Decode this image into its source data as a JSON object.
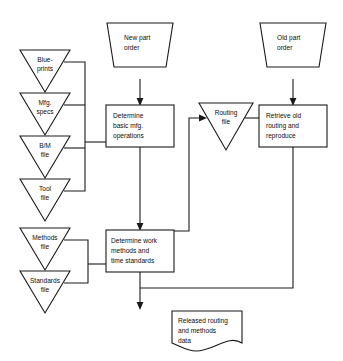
{
  "diagram": {
    "style": {
      "background": "#ffffff",
      "line_color": "#1a1a1a",
      "text_color": "#0d0d0d",
      "shape_fill": "#ffffff"
    },
    "nodes": [
      {
        "id": "blueprints",
        "shape": "triangle-file",
        "lines": [
          "Blue-",
          "prints"
        ],
        "x": 45,
        "y": 50
      },
      {
        "id": "mfg-specs",
        "shape": "triangle-file",
        "lines": [
          "Mfg.",
          "specs"
        ],
        "x": 45,
        "y": 93
      },
      {
        "id": "bm-file",
        "shape": "triangle-file",
        "lines": [
          "B/M",
          "file"
        ],
        "x": 45,
        "y": 136
      },
      {
        "id": "tool-file",
        "shape": "triangle-file",
        "lines": [
          "Tool",
          "file"
        ],
        "x": 45,
        "y": 179
      },
      {
        "id": "methods-file",
        "shape": "triangle-file",
        "lines": [
          "Methods",
          "file"
        ],
        "x": 45,
        "y": 228
      },
      {
        "id": "standards-file",
        "shape": "triangle-file",
        "lines": [
          "Standards",
          "file"
        ],
        "x": 45,
        "y": 271
      },
      {
        "id": "new-part-order",
        "shape": "trapezoid-input",
        "lines": [
          "New part",
          "order"
        ],
        "x": 140,
        "y": 44
      },
      {
        "id": "old-part-order",
        "shape": "trapezoid-input",
        "lines": [
          "Old part",
          "order"
        ],
        "x": 293,
        "y": 44
      },
      {
        "id": "determine-basic-ops",
        "shape": "process-box",
        "lines": [
          "Determine",
          "basic mfg.",
          "operations"
        ],
        "x": 140,
        "y": 126
      },
      {
        "id": "determine-work-methods",
        "shape": "process-box",
        "lines": [
          "Determine work",
          "methods and",
          "time standards"
        ],
        "x": 140,
        "y": 251
      },
      {
        "id": "routing-file",
        "shape": "triangle-file",
        "lines": [
          "Routing",
          "file"
        ],
        "x": 226,
        "y": 120
      },
      {
        "id": "retrieve-old-routing",
        "shape": "process-box",
        "lines": [
          "Retrieve old",
          "routing and",
          "reproduce"
        ],
        "x": 293,
        "y": 126
      },
      {
        "id": "released-routing-data",
        "shape": "document",
        "lines": [
          "Released routing",
          "and methods",
          "data"
        ],
        "x": 207,
        "y": 325
      }
    ],
    "edges": [
      {
        "id": "blueprints-to-bus-top",
        "from": "blueprints",
        "to": "bus-top"
      },
      {
        "id": "mfg-specs-to-bus-top",
        "from": "mfg-specs",
        "to": "bus-top"
      },
      {
        "id": "bm-file-to-bus-top",
        "from": "bm-file",
        "to": "bus-top"
      },
      {
        "id": "tool-file-to-bus-top",
        "from": "tool-file",
        "to": "bus-top"
      },
      {
        "id": "bus-top-to-determine-basic-ops",
        "from": "bus-top",
        "to": "determine-basic-ops"
      },
      {
        "id": "methods-file-to-bus-bottom",
        "from": "methods-file",
        "to": "bus-bottom"
      },
      {
        "id": "standards-file-to-bus-bottom",
        "from": "standards-file",
        "to": "bus-bottom"
      },
      {
        "id": "bus-bottom-to-determine-work-methods",
        "from": "bus-bottom",
        "to": "determine-work-methods"
      },
      {
        "id": "new-part-order-to-determine-basic-ops",
        "from": "new-part-order",
        "to": "determine-basic-ops"
      },
      {
        "id": "determine-basic-ops-to-determine-work-methods",
        "from": "determine-basic-ops",
        "to": "determine-work-methods"
      },
      {
        "id": "determine-work-methods-to-routing-file",
        "from": "determine-work-methods",
        "to": "routing-file"
      },
      {
        "id": "routing-file-to-retrieve-old-routing",
        "from": "routing-file",
        "to": "retrieve-old-routing"
      },
      {
        "id": "old-part-order-to-retrieve-old-routing",
        "from": "old-part-order",
        "to": "retrieve-old-routing"
      },
      {
        "id": "determine-work-methods-to-released-data",
        "from": "determine-work-methods",
        "to": "released-routing-data"
      },
      {
        "id": "retrieve-old-routing-to-released-data",
        "from": "retrieve-old-routing",
        "to": "released-routing-data"
      }
    ]
  }
}
